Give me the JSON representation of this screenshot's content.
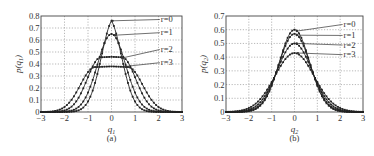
{
  "chart_data": [
    {
      "panel": "(a)",
      "type": "line",
      "title": "",
      "xlabel": "q1",
      "ylabel": "p(q1)",
      "xlim": [
        -3,
        3
      ],
      "ylim": [
        0,
        0.8
      ],
      "xticks": [
        -3,
        -2,
        -1,
        0,
        1,
        2,
        3
      ],
      "yticks": [
        0,
        0.1,
        0.2,
        0.3,
        0.4,
        0.5,
        0.6,
        0.7,
        0.8
      ],
      "ytick_labels": [
        "0",
        "0.1",
        "0.2",
        "0.3",
        "0.4",
        "0.5",
        "0.6",
        "0.7",
        "0.8"
      ],
      "grid": true,
      "caption": "(a)",
      "series": [
        {
          "name": "r=0",
          "peak": 0.76,
          "shape": "sharp",
          "width": 0.52,
          "flat": 0.0
        },
        {
          "name": "r=1",
          "peak": 0.65,
          "shape": "gauss",
          "width": 0.6,
          "flat": 0.0
        },
        {
          "name": "r=2",
          "peak": 0.46,
          "shape": "flat",
          "width": 0.58,
          "flat": 0.45
        },
        {
          "name": "r=3",
          "peak": 0.38,
          "shape": "flat",
          "width": 0.62,
          "flat": 0.7
        }
      ],
      "annotations": [
        {
          "text": "r=0",
          "label_x": 2.1,
          "label_y": 0.75,
          "target_x": 0.05,
          "target_y": 0.76
        },
        {
          "text": "r=1",
          "label_x": 2.1,
          "label_y": 0.64,
          "target_x": 0.15,
          "target_y": 0.64
        },
        {
          "text": "r=2",
          "label_x": 2.1,
          "label_y": 0.5,
          "target_x": 0.45,
          "target_y": 0.45
        },
        {
          "text": "r=3",
          "label_x": 2.1,
          "label_y": 0.39,
          "target_x": 0.6,
          "target_y": 0.38
        }
      ]
    },
    {
      "panel": "(b)",
      "type": "line",
      "title": "",
      "xlabel": "q2",
      "ylabel": "p(q2)",
      "xlim": [
        -3,
        3
      ],
      "ylim": [
        0,
        0.7
      ],
      "xticks": [
        -3,
        -2,
        -1,
        0,
        1,
        2,
        3
      ],
      "yticks": [
        0,
        0.1,
        0.2,
        0.3,
        0.4,
        0.5,
        0.6,
        0.7
      ],
      "ytick_labels": [
        "0",
        "0.1",
        "0.2",
        "0.3",
        "0.4",
        "0.5",
        "0.6",
        "0.7"
      ],
      "grid": true,
      "caption": "(b)",
      "series": [
        {
          "name": "r=0",
          "peak": 0.6,
          "shape": "gauss",
          "width": 0.66,
          "flat": 0.0
        },
        {
          "name": "r=1",
          "peak": 0.57,
          "shape": "gauss",
          "width": 0.69,
          "flat": 0.0
        },
        {
          "name": "r=2",
          "peak": 0.5,
          "shape": "gauss",
          "width": 0.76,
          "flat": 0.0
        },
        {
          "name": "r=3",
          "peak": 0.43,
          "shape": "gauss",
          "width": 0.86,
          "flat": 0.0
        }
      ],
      "annotations": [
        {
          "text": "r=0",
          "label_x": 2.15,
          "label_y": 0.62,
          "target_x": 0.1,
          "target_y": 0.59
        },
        {
          "text": "r=1",
          "label_x": 2.15,
          "label_y": 0.54,
          "target_x": 0.1,
          "target_y": 0.56
        },
        {
          "text": "r=2",
          "label_x": 2.15,
          "label_y": 0.47,
          "target_x": 0.1,
          "target_y": 0.5
        },
        {
          "text": "r=3",
          "label_x": 2.15,
          "label_y": 0.4,
          "target_x": 0.15,
          "target_y": 0.43
        }
      ]
    }
  ],
  "layout": {
    "panels": [
      {
        "left": 41,
        "top": 16,
        "width": 141,
        "height": 96
      },
      {
        "left": 226,
        "top": 16,
        "width": 137,
        "height": 96
      }
    ]
  }
}
